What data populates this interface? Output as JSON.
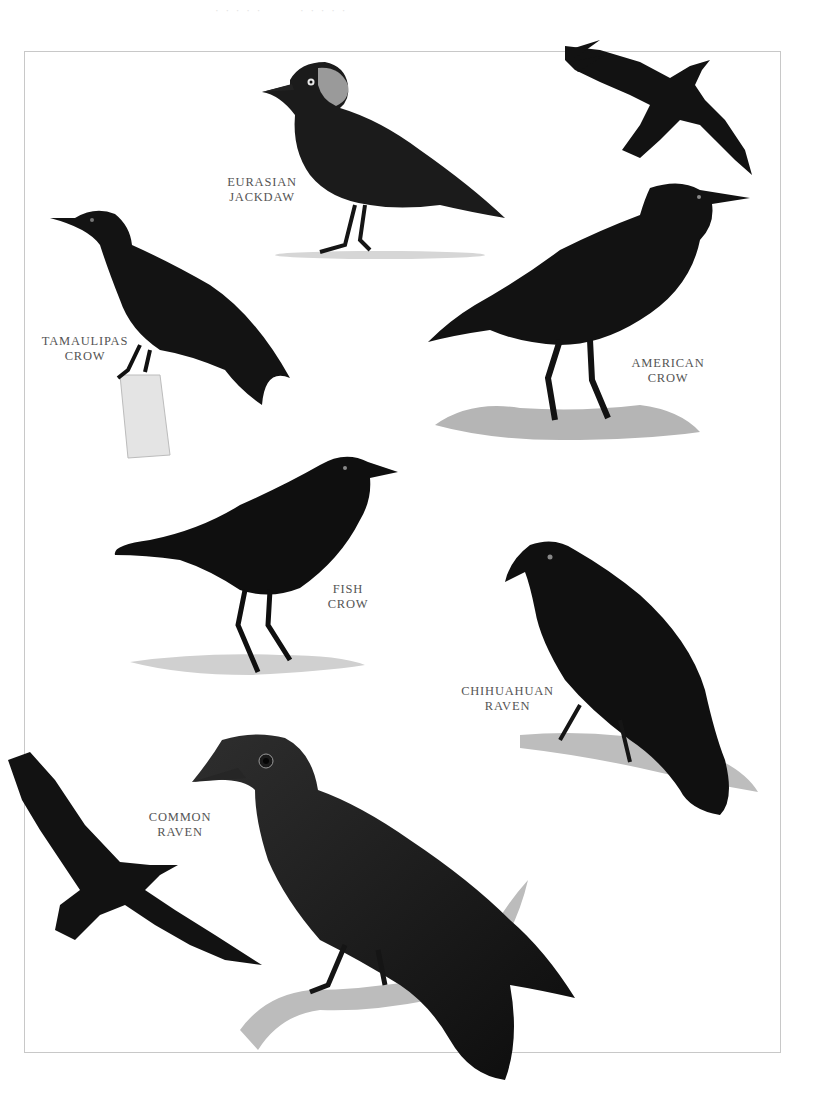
{
  "plate": {
    "header_ghost_text": [
      "· · · · ·",
      "· · · · ·"
    ],
    "colors": {
      "plumage": "#111111",
      "plumage_mid": "#2a2a2a",
      "frame": "#c8c8c8",
      "label": "#555555",
      "perch": "#a8a8a8",
      "ground": "#cfcfcf"
    }
  },
  "species": [
    {
      "id": "eurasian-jackdaw",
      "label_lines": [
        "EURASIAN",
        "JACKDAW"
      ],
      "pose": "standing on ground"
    },
    {
      "id": "tamaulipas-crow",
      "label_lines": [
        "TAMAULIPAS",
        "CROW"
      ],
      "pose": "perched on post"
    },
    {
      "id": "american-crow",
      "label_lines": [
        "AMERICAN",
        "CROW"
      ],
      "pose": "standing in grass, plus flying figure"
    },
    {
      "id": "fish-crow",
      "label_lines": [
        "FISH",
        "CROW"
      ],
      "pose": "standing on ground"
    },
    {
      "id": "chihuahuan-raven",
      "label_lines": [
        "CHIHUAHUAN",
        "RAVEN"
      ],
      "pose": "perched on branch"
    },
    {
      "id": "common-raven",
      "label_lines": [
        "COMMON",
        "RAVEN"
      ],
      "pose": "perched on branch, plus flying figure"
    }
  ]
}
